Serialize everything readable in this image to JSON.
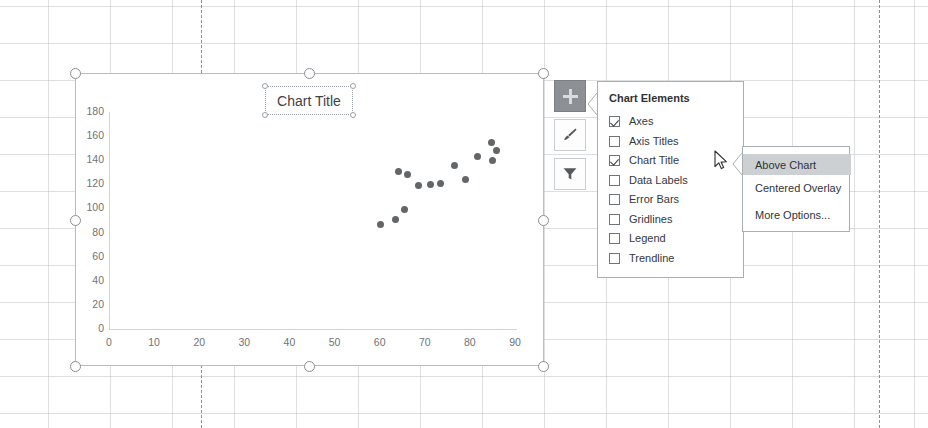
{
  "app": {
    "context": "excel-worksheet-with-chart"
  },
  "chart": {
    "title": "Chart Title",
    "title_selected": true,
    "object_selected": true
  },
  "chart_data": {
    "type": "scatter",
    "title": "Chart Title",
    "xlabel": "",
    "ylabel": "",
    "xlim": [
      0,
      90
    ],
    "ylim": [
      0,
      180
    ],
    "xticks": [
      0,
      10,
      20,
      30,
      40,
      50,
      60,
      70,
      80,
      90
    ],
    "yticks": [
      0,
      20,
      40,
      60,
      80,
      100,
      120,
      140,
      160,
      180
    ],
    "grid": false,
    "legend": false,
    "marker_color": "#636669",
    "series": [
      {
        "name": "Series 1",
        "points": [
          [
            60.0,
            87
          ],
          [
            63.2,
            91
          ],
          [
            65.3,
            99
          ],
          [
            64.0,
            131
          ],
          [
            66.0,
            128
          ],
          [
            68.4,
            119
          ],
          [
            71.0,
            120
          ],
          [
            73.2,
            121
          ],
          [
            76.3,
            136
          ],
          [
            78.8,
            124
          ],
          [
            81.5,
            143
          ],
          [
            84.6,
            155
          ],
          [
            84.8,
            140
          ],
          [
            85.6,
            148
          ]
        ]
      }
    ]
  },
  "side_buttons": [
    {
      "icon": "plus-icon",
      "name": "chart-elements-button",
      "active": true
    },
    {
      "icon": "paintbrush-icon",
      "name": "chart-styles-button",
      "active": false
    },
    {
      "icon": "funnel-icon",
      "name": "chart-filters-button",
      "active": false
    }
  ],
  "chart_elements": {
    "heading": "Chart Elements",
    "items": [
      {
        "label": "Axes",
        "checked": true
      },
      {
        "label": "Axis Titles",
        "checked": false
      },
      {
        "label": "Chart Title",
        "checked": true
      },
      {
        "label": "Data Labels",
        "checked": false
      },
      {
        "label": "Error Bars",
        "checked": false
      },
      {
        "label": "Gridlines",
        "checked": false
      },
      {
        "label": "Legend",
        "checked": false
      },
      {
        "label": "Trendline",
        "checked": false
      }
    ]
  },
  "submenu": {
    "items": [
      {
        "label": "Above Chart",
        "selected": true
      },
      {
        "label": "Centered Overlay",
        "selected": false
      },
      {
        "label": "More Options...",
        "selected": false
      }
    ]
  },
  "colors": {
    "marker": "#636669",
    "pane_border": "#a9aeb2",
    "highlight": "#cdd0d3",
    "active_button": "#8c9094",
    "axis": "#d2d5d8",
    "tick_text": "#6f7377"
  }
}
